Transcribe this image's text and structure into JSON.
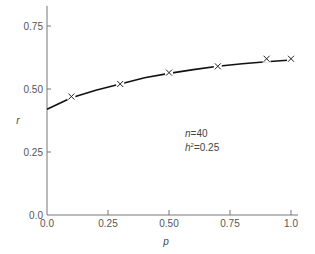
{
  "chart_data": {
    "type": "line",
    "title": "",
    "xlabel": "p",
    "ylabel": "r",
    "xlim": [
      0.0,
      1.0
    ],
    "ylim": [
      0.0,
      0.83
    ],
    "grid": false,
    "legend": null,
    "x_ticks": [
      "0.0",
      "0.25",
      "0.50",
      "0.75",
      "1.0"
    ],
    "y_ticks": [
      "0.0",
      "0.25",
      "0.50",
      "0.75"
    ],
    "series": [
      {
        "name": "observed",
        "marker": "x",
        "x": [
          0.1,
          0.3,
          0.5,
          0.7,
          0.9,
          1.0
        ],
        "values": [
          0.47,
          0.52,
          0.565,
          0.59,
          0.62,
          0.62
        ]
      },
      {
        "name": "fitted curve",
        "marker": "none",
        "x": [
          0.0,
          0.1,
          0.2,
          0.3,
          0.4,
          0.5,
          0.6,
          0.7,
          0.8,
          0.9,
          1.0
        ],
        "values": [
          0.42,
          0.465,
          0.495,
          0.52,
          0.545,
          0.562,
          0.577,
          0.59,
          0.6,
          0.608,
          0.615
        ]
      }
    ],
    "annotations": [
      {
        "text_n": "n=40",
        "text_h": "h²=0.25",
        "x": 0.5,
        "y": 0.4
      }
    ]
  },
  "labels": {
    "x_axis": "p",
    "y_axis": "r",
    "annot_n_var": "n",
    "annot_n_val": "=40",
    "annot_h_var": "h",
    "annot_h_sup": "2",
    "annot_h_val": "=0.25"
  }
}
